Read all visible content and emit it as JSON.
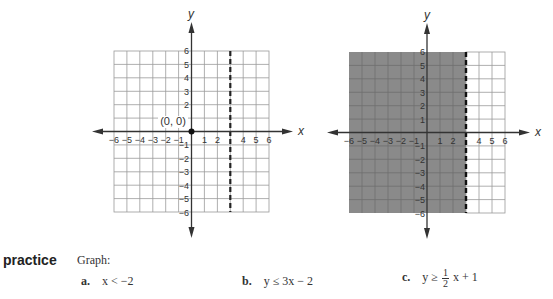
{
  "graphs": [
    {
      "id": "graph-left",
      "description": "Boundary line x = 3 (dashed) with origin test point",
      "axis_x_label": "x",
      "axis_y_label": "y",
      "x_ticks": [
        "−6",
        "−5",
        "−4",
        "−3",
        "−2",
        "−1",
        "1",
        "2",
        "4",
        "5",
        "6"
      ],
      "y_ticks": [
        "6",
        "5",
        "4",
        "3",
        "2",
        "−1",
        "−2",
        "−3",
        "−4",
        "−5",
        "−6"
      ],
      "point_label": "(0, 0)",
      "boundary": {
        "type": "vertical",
        "x": 3,
        "style": "dashed"
      },
      "shaded": false
    },
    {
      "id": "graph-right",
      "description": "Graph of x < 3 with region left of dashed line shaded",
      "axis_x_label": "x",
      "axis_y_label": "y",
      "left_edge_label": "x",
      "x_ticks": [
        "−6",
        "−5",
        "−4",
        "−3",
        "−2",
        "−1",
        "1",
        "2",
        "4",
        "5",
        "6"
      ],
      "y_ticks": [
        "6",
        "5",
        "4",
        "3",
        "2",
        "1",
        "−1",
        "−2",
        "−3",
        "−4",
        "−5",
        "−6"
      ],
      "boundary": {
        "type": "vertical",
        "x": 3,
        "style": "dashed"
      },
      "shaded": true,
      "shade_color": "#8a8a8a"
    }
  ],
  "practice": {
    "title": "practice",
    "prompt": "Graph:",
    "items": [
      {
        "letter": "a.",
        "expr": "x < −2"
      },
      {
        "letter": "b.",
        "expr": "y ≤ 3x − 2"
      },
      {
        "letter": "c.",
        "lhs": "y ≥ ",
        "frac_num": "1",
        "frac_den": "2",
        "rhs": "x + 1"
      }
    ]
  },
  "colors": {
    "grid_line": "#9a9a9a",
    "axis": "#333333",
    "shade": "#8a8a8a",
    "text": "#333333"
  }
}
